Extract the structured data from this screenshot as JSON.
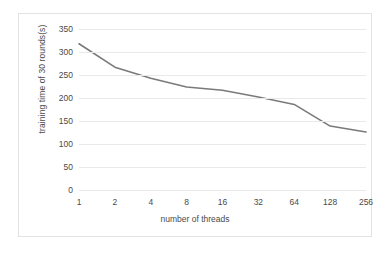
{
  "chart_data": {
    "type": "line",
    "title": "",
    "xlabel": "number of threads",
    "ylabel": "training time of 30 rounds(s)",
    "categories": [
      "1",
      "2",
      "4",
      "8",
      "16",
      "32",
      "64",
      "128",
      "256"
    ],
    "values": [
      318,
      267,
      243,
      224,
      217,
      202,
      186,
      139,
      126
    ],
    "yticks": [
      "0",
      "50",
      "100",
      "150",
      "200",
      "250",
      "300",
      "350"
    ],
    "ytick_values": [
      0,
      50,
      100,
      150,
      200,
      250,
      300,
      350
    ],
    "ylim": [
      0,
      350
    ],
    "grid": true,
    "legend": false,
    "series_color": "#7a7a7a",
    "gridline_color": "#e9e9e9",
    "frame_color": "#e3e3e3",
    "text_color": "#4a4a4a"
  }
}
